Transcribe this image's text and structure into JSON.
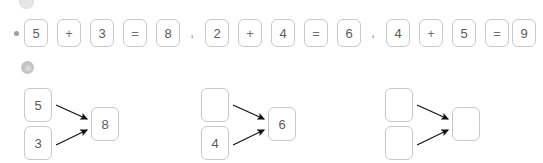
{
  "page": {
    "background_color": "#ffffff",
    "cell_border_color": "#c9c9c9",
    "cell_text_color": "#5a5a5a",
    "arrow_color": "#111111",
    "badge_color": "#c4c4c4",
    "bullet_color": "#9e9e9e"
  },
  "top_marker": {
    "icon": "faint-circle-marker"
  },
  "equations_row": {
    "bullet": "•",
    "separator": ",",
    "equations": [
      {
        "id": "equation-1",
        "cells": [
          {
            "value": "5",
            "role": "addend"
          },
          {
            "value": "+",
            "role": "operator"
          },
          {
            "value": "3",
            "role": "addend"
          },
          {
            "value": "=",
            "role": "operator"
          },
          {
            "value": "8",
            "role": "sum"
          }
        ]
      },
      {
        "id": "equation-2",
        "cells": [
          {
            "value": "2",
            "role": "addend"
          },
          {
            "value": "+",
            "role": "operator"
          },
          {
            "value": "4",
            "role": "addend"
          },
          {
            "value": "=",
            "role": "operator"
          },
          {
            "value": "6",
            "role": "sum"
          }
        ]
      },
      {
        "id": "equation-3",
        "cells": [
          {
            "value": "4",
            "role": "addend"
          },
          {
            "value": "+",
            "role": "operator"
          },
          {
            "value": "5",
            "role": "addend"
          },
          {
            "value": "=",
            "role": "operator"
          },
          {
            "value": "9",
            "role": "sum"
          }
        ]
      }
    ]
  },
  "section_badge": {
    "label": "◎"
  },
  "diagrams_row": {
    "diagrams": [
      {
        "id": "diagram-1",
        "top_input": "5",
        "bottom_input": "3",
        "output": "8"
      },
      {
        "id": "diagram-2",
        "top_input": "",
        "bottom_input": "4",
        "output": "6"
      },
      {
        "id": "diagram-3",
        "top_input": "",
        "bottom_input": "",
        "output": ""
      }
    ]
  }
}
